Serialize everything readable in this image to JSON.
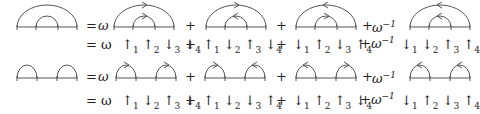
{
  "equations": [
    {
      "lhs": {
        "type": "nested",
        "arcs": [
          [
            1,
            4
          ],
          [
            2,
            3
          ]
        ]
      },
      "terms": [
        {
          "coef": "ω",
          "prefix": "= ",
          "arrows": {
            "outer": "right",
            "inner": "right"
          }
        },
        {
          "coef": "",
          "prefix": "+",
          "arrows": {
            "outer": "right",
            "inner": "left"
          }
        },
        {
          "coef": "",
          "prefix": "+",
          "arrows": {
            "outer": "left",
            "inner": "right"
          }
        },
        {
          "coef": "ω⁻¹",
          "prefix": "+",
          "arrows": {
            "outer": "left",
            "inner": "left"
          }
        }
      ],
      "expansion": {
        "lead": "= ω",
        "terms": [
          {
            "prefix": "",
            "spins": [
              "↑1",
              "↑2",
              "↓3",
              "↓4"
            ]
          },
          {
            "prefix": "+",
            "spins": [
              "↑1",
              "↓2",
              "↑3",
              "↓4"
            ]
          },
          {
            "prefix": "+",
            "spins": [
              "↓1",
              "↑2",
              "↓3",
              "↑4"
            ]
          },
          {
            "prefix": "+ω⁻¹",
            "spins": [
              "↓1",
              "↓2",
              "↑3",
              "↑4"
            ]
          }
        ]
      }
    },
    {
      "lhs": {
        "type": "adjacent",
        "arcs": [
          [
            1,
            2
          ],
          [
            3,
            4
          ]
        ]
      },
      "terms": [
        {
          "coef": "ω",
          "prefix": "= ",
          "arrows": {
            "left": "right",
            "right": "right"
          }
        },
        {
          "coef": "",
          "prefix": "+",
          "arrows": {
            "left": "right",
            "right": "left"
          }
        },
        {
          "coef": "",
          "prefix": "+",
          "arrows": {
            "left": "left",
            "right": "right"
          }
        },
        {
          "coef": "ω⁻¹",
          "prefix": "+",
          "arrows": {
            "left": "left",
            "right": "left"
          }
        }
      ],
      "expansion": {
        "lead": "= ω",
        "terms": [
          {
            "prefix": "",
            "spins": [
              "↑1",
              "↓2",
              "↑3",
              "↓4"
            ]
          },
          {
            "prefix": "+",
            "spins": [
              "↑1",
              "↓2",
              "↓3",
              "↑4"
            ]
          },
          {
            "prefix": "+",
            "spins": [
              "↓1",
              "↑2",
              "↑3",
              "↓4"
            ]
          },
          {
            "prefix": "+ω⁻¹",
            "spins": [
              "↓1",
              "↑2",
              "↓3",
              "↑4"
            ]
          }
        ]
      }
    }
  ],
  "labels": {
    "eq": "=",
    "omega": "ω",
    "plus": "+",
    "omega_inv_base": "ω",
    "omega_inv_exp": "−1",
    "tick_labels": [
      "1",
      "2",
      "3",
      "4"
    ]
  },
  "colors": {
    "stroke": "#555555",
    "text": "#222222"
  }
}
